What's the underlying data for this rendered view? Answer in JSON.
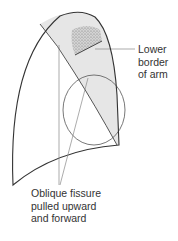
{
  "diagram": {
    "labels": {
      "lower_border_of_arm": [
        "Lower",
        "border",
        "of arm"
      ],
      "oblique_fissure": [
        "Oblique fissure",
        "pulled upward",
        "and forward"
      ]
    },
    "colors": {
      "outline": "#333333",
      "shading": "#e4e4e4",
      "stipple": "#9a9a9a",
      "leader": "#888888",
      "text": "#333333"
    }
  }
}
